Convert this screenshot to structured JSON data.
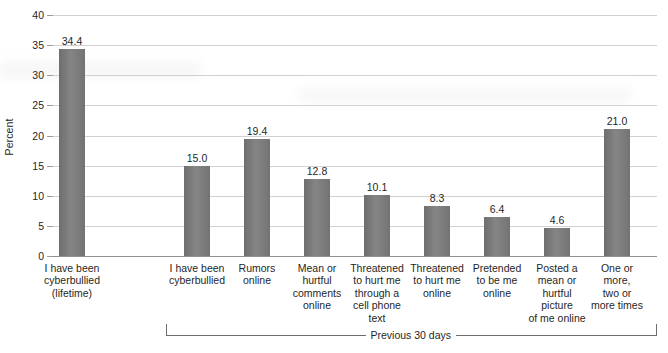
{
  "chart_data": {
    "type": "bar",
    "title": "",
    "xlabel": "",
    "ylabel": "Percent",
    "ylim": [
      0,
      40
    ],
    "ytick_step": 5,
    "yticks": [
      0,
      5,
      10,
      15,
      20,
      25,
      30,
      35,
      40
    ],
    "ytick_labels": [
      "0",
      "5",
      "10",
      "15",
      "20",
      "25",
      "30",
      "35",
      "40"
    ],
    "grid": true,
    "legend": "none",
    "bar_color": "#7a7a7a",
    "categories": [
      "I have been cyberbullied (lifetime)",
      "I have been cyberbullied",
      "Rumors online",
      "Mean or hurtful comments online",
      "Threatened to hurt me through a cell phone text",
      "Threatened to hurt me online",
      "Pretended to be me online",
      "Posted a mean or hurtful picture of me online",
      "One or more, two or more times"
    ],
    "category_lines": [
      [
        "I have been",
        "cyberbullied",
        "(lifetime)"
      ],
      [
        "I have been",
        "cyberbullied"
      ],
      [
        "Rumors",
        "online"
      ],
      [
        "Mean or",
        "hurtful",
        "comments",
        "online"
      ],
      [
        "Threatened",
        "to hurt me",
        "through a",
        "cell phone",
        "text"
      ],
      [
        "Threatened",
        "to hurt me",
        "online"
      ],
      [
        "Pretended",
        "to be me",
        "online"
      ],
      [
        "Posted a",
        "mean or",
        "hurtful",
        "picture",
        "of me online"
      ],
      [
        "One or",
        "more,",
        "two or",
        "more times"
      ]
    ],
    "values": [
      34.4,
      15.0,
      19.4,
      12.8,
      10.1,
      8.3,
      6.4,
      4.6,
      21.0
    ],
    "value_labels": [
      "34.4",
      "15.0",
      "19.4",
      "12.8",
      "10.1",
      "8.3",
      "6.4",
      "4.6",
      "21.0"
    ],
    "annotations": [
      {
        "name": "previous-30-days-bracket",
        "label": "Previous 30 days",
        "spans_categories": [
          1,
          8
        ]
      }
    ]
  }
}
